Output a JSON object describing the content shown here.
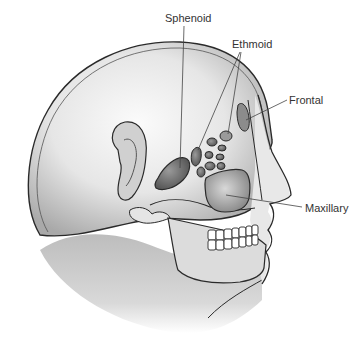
{
  "diagram": {
    "labels": [
      {
        "id": "sphenoid",
        "text": "Sphenoid",
        "x": 165,
        "y": 12
      },
      {
        "id": "ethmoid",
        "text": "Ethmoid",
        "x": 232,
        "y": 38
      },
      {
        "id": "frontal",
        "text": "Frontal",
        "x": 289,
        "y": 94
      },
      {
        "id": "maxillary",
        "text": "Maxillary",
        "x": 305,
        "y": 202
      }
    ],
    "colors": {
      "outline": "#2a2a2a",
      "skin_light": "#f2f2f2",
      "skin_mid": "#c8c8c8",
      "skin_dark": "#8a8a8a",
      "sinus_fill": "#6e6e6e",
      "leader_line": "#444444",
      "label_text": "#333333"
    }
  }
}
